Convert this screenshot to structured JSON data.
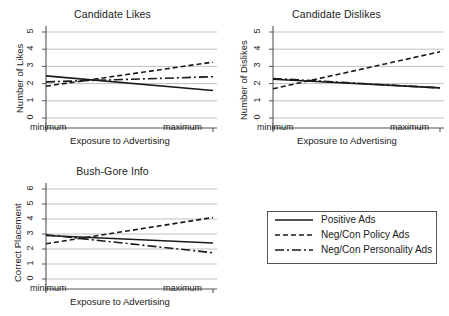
{
  "figure": {
    "background": "#ffffff",
    "line_color": "#1a1a1a",
    "grid_color": "#b9b9b9",
    "axis_color": "#555555"
  },
  "legend": {
    "name": "series-legend",
    "entries": [
      {
        "label": "Positive Ads",
        "style": "solid"
      },
      {
        "label": "Neg/Con Policy Ads",
        "style": "dashed"
      },
      {
        "label": "Neg/Con Personality Ads",
        "style": "dashdot"
      }
    ]
  },
  "chart_data": [
    {
      "type": "line",
      "title": "Candidate Likes",
      "xlabel": "Exposure to Advertising",
      "ylabel": "Number of Likes",
      "x": [
        0,
        1
      ],
      "xticklabels": [
        "minimum",
        "maximum"
      ],
      "yticklabels": [
        "0",
        "1",
        "2",
        "3",
        "4",
        "5"
      ],
      "ylim": [
        0,
        5
      ],
      "xlim": [
        0,
        1
      ],
      "grid": true,
      "legend_position": "external-bottom-right",
      "series": [
        {
          "name": "Positive Ads",
          "style": "solid",
          "values": [
            2.45,
            1.6
          ]
        },
        {
          "name": "Neg/Con Policy Ads",
          "style": "dashed",
          "values": [
            1.85,
            3.25
          ]
        },
        {
          "name": "Neg/Con Personality Ads",
          "style": "dashdot",
          "values": [
            2.1,
            2.4
          ]
        }
      ]
    },
    {
      "type": "line",
      "title": "Candidate Dislikes",
      "xlabel": "Exposure to Advertising",
      "ylabel": "Number of Dislikes",
      "x": [
        0,
        1
      ],
      "xticklabels": [
        "minimum",
        "maximum"
      ],
      "yticklabels": [
        "0",
        "1",
        "2",
        "3",
        "4",
        "5"
      ],
      "ylim": [
        0,
        5
      ],
      "xlim": [
        0,
        1
      ],
      "grid": true,
      "legend_position": "external-bottom-right",
      "series": [
        {
          "name": "Positive Ads",
          "style": "solid",
          "values": [
            2.25,
            1.75
          ]
        },
        {
          "name": "Neg/Con Policy Ads",
          "style": "dashed",
          "values": [
            1.7,
            3.85
          ]
        },
        {
          "name": "Neg/Con Personality Ads",
          "style": "dashdot",
          "values": [
            2.3,
            1.75
          ]
        }
      ]
    },
    {
      "type": "line",
      "title": "Bush-Gore Info",
      "xlabel": "Exposure to Advertising",
      "ylabel": "Correct Placement",
      "x": [
        0,
        1
      ],
      "xticklabels": [
        "minimum",
        "maximum"
      ],
      "yticklabels": [
        "0",
        "1",
        "2",
        "3",
        "4",
        "5",
        "6"
      ],
      "ylim": [
        0,
        6
      ],
      "xlim": [
        0,
        1
      ],
      "grid": true,
      "legend_position": "external-right",
      "series": [
        {
          "name": "Positive Ads",
          "style": "solid",
          "values": [
            2.9,
            2.4
          ]
        },
        {
          "name": "Neg/Con Policy Ads",
          "style": "dashed",
          "values": [
            2.35,
            4.1
          ]
        },
        {
          "name": "Neg/Con Personality Ads",
          "style": "dashdot",
          "values": [
            2.95,
            1.75
          ]
        }
      ]
    }
  ]
}
